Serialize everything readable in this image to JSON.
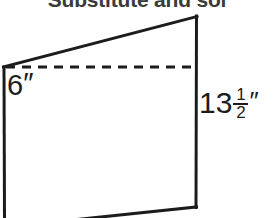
{
  "page": {
    "title": "Substitute and sol",
    "background_color": "#ffffff",
    "width": 274,
    "height": 218
  },
  "figure": {
    "name": "parallelogram-diagram",
    "stroke_color": "#1c1c1c",
    "stroke_width": 3,
    "dash_stroke_width": 3,
    "dash_pattern": "9 7",
    "solid_outline_points": "4,67 197,17 196,207 88,218",
    "left_edge": {
      "x1": 4,
      "y1": 67,
      "x2": 4,
      "y2": 218
    },
    "top_slant_edge": {
      "x1": 4,
      "y1": 67,
      "x2": 197,
      "y2": 17
    },
    "right_edge": {
      "x1": 197,
      "y1": 17,
      "x2": 196,
      "y2": 207
    },
    "bottom_slant_edge": {
      "x1": 196,
      "y1": 207,
      "x2": 88,
      "y2": 218
    },
    "dashed_height_line": {
      "x1": 5,
      "y1": 67,
      "x2": 196,
      "y2": 67
    }
  },
  "labels": {
    "height": {
      "name": "height-label",
      "value": "6",
      "unit": "″",
      "full": "6″"
    },
    "side": {
      "name": "side-length-label",
      "whole": "13",
      "numerator": "1",
      "denominator": "2",
      "unit": "″",
      "full": "13 1/2″"
    }
  }
}
